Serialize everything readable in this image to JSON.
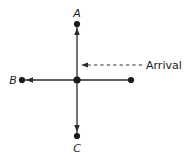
{
  "figure": {
    "type": "diagram",
    "kind": "vector-direction-diagram",
    "background_color": "#ffffff",
    "line_color": "#2b2b2b",
    "text_color": "#1a1a1a",
    "width": 187,
    "height": 162
  },
  "labels": {
    "top": "A",
    "left": "B",
    "bottom": "C",
    "annotation": "Arrival"
  },
  "nodes": [
    {
      "name": "point-a",
      "label": "A",
      "x": 77,
      "y": 24
    },
    {
      "name": "point-b",
      "label": "B",
      "x": 22,
      "y": 80
    },
    {
      "name": "point-c",
      "label": "C",
      "x": 77,
      "y": 136
    },
    {
      "name": "center-point",
      "label": "",
      "x": 77,
      "y": 80
    },
    {
      "name": "arrival-origin-point",
      "label": "",
      "x": 131,
      "y": 80
    }
  ],
  "edges": [
    {
      "name": "axis-vertical",
      "from": "point-c",
      "to": "point-a",
      "style": "solid",
      "arrow_up": true,
      "arrow_down": true
    },
    {
      "name": "axis-horizontal",
      "from": "arrival-origin-point",
      "to": "point-b",
      "style": "solid",
      "arrow_left": true
    },
    {
      "name": "arrival-arrow",
      "from": 142,
      "to": 82,
      "y": 65,
      "style": "dashed",
      "arrow_left": true
    }
  ],
  "annotation": {
    "text": "Arrival",
    "x": 144,
    "y": 69,
    "arrow_direction": "left",
    "arrow_style": "dashed"
  }
}
